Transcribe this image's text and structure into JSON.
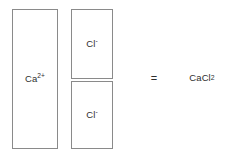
{
  "diagram": {
    "colors": {
      "background": "#ffffff",
      "box_border": "#8a8a8a",
      "text": "#2e2e2e"
    },
    "ions": [
      {
        "id": "calcium-cation",
        "element": "Ca",
        "charge": "2+",
        "label": "Ca2+",
        "count": 1
      },
      {
        "id": "chloride-anion-1",
        "element": "Cl",
        "charge": "-",
        "label": "Cl-",
        "count": 1
      },
      {
        "id": "chloride-anion-2",
        "element": "Cl",
        "charge": "-",
        "label": "Cl-",
        "count": 1
      }
    ],
    "operator": "=",
    "product": {
      "base_1": "CaCl",
      "subscript_1": "2",
      "full": "CaCl2"
    }
  }
}
